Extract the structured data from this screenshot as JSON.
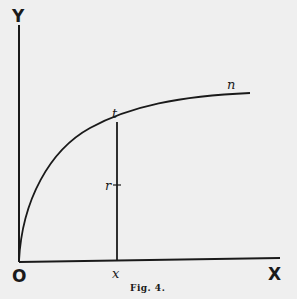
{
  "figure": {
    "caption": "Fig. 4.",
    "axes": {
      "y_label": "Y",
      "x_label": "X",
      "origin_label": "O"
    },
    "points": {
      "t_label": "t",
      "n_label": "n",
      "x_label": "x",
      "r_label": "r"
    },
    "colors": {
      "background": "#efefef",
      "ink": "#1a1a1a"
    }
  }
}
